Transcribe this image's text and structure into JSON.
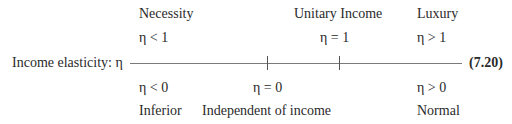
{
  "axis_label": "Income elasticity: η",
  "equation_number": "(7.20)",
  "top": {
    "necessity": {
      "label": "Necessity",
      "condition": "η < 1"
    },
    "unitary": {
      "label": "Unitary Income",
      "condition": "η = 1"
    },
    "luxury": {
      "label": "Luxury",
      "condition": "η > 1"
    }
  },
  "bottom": {
    "inferior": {
      "condition": "η < 0",
      "label": "Inferior"
    },
    "independent": {
      "condition": "η = 0",
      "label": "Independent of income"
    },
    "normal": {
      "condition": "η > 0",
      "label": "Normal"
    }
  },
  "ticks": [
    {
      "value": "0"
    },
    {
      "value": "1"
    }
  ]
}
